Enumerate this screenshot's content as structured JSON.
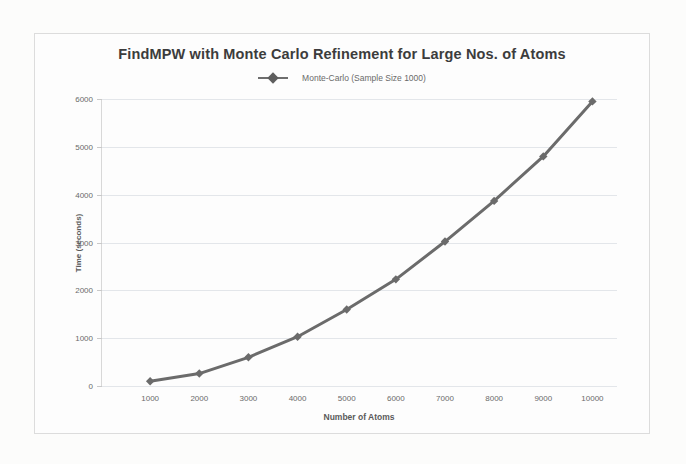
{
  "chart_data": {
    "type": "line",
    "title": "FindMPW with Monte Carlo Refinement for Large Nos. of Atoms",
    "xlabel": "Number of Atoms",
    "ylabel": "Time (seconds)",
    "xlim": [
      0,
      10500
    ],
    "ylim": [
      0,
      6000
    ],
    "grid": true,
    "legend_position": "top-center",
    "x_tick_labels": [
      "1000",
      "2000",
      "3000",
      "4000",
      "5000",
      "6000",
      "7000",
      "8000",
      "9000",
      "10000"
    ],
    "y_tick_labels": [
      "0",
      "1000",
      "2000",
      "3000",
      "4000",
      "5000",
      "6000"
    ],
    "x": [
      1000,
      2000,
      3000,
      4000,
      5000,
      6000,
      7000,
      8000,
      9000,
      10000
    ],
    "series": [
      {
        "name": "Monte-Carlo (Sample Size  1000)",
        "color": "#6b6b6b",
        "marker": "diamond",
        "values": [
          100,
          260,
          600,
          1030,
          1600,
          2230,
          3020,
          3870,
          4800,
          5950
        ]
      }
    ]
  },
  "legend": {
    "entries": [
      {
        "label": "Monte-Carlo (Sample Size  1000)"
      }
    ]
  },
  "colors": {
    "series": "#6b6b6b",
    "grid": "#e3e6ea",
    "axis": "#d8d8d8",
    "text": "#6a6a6a",
    "title": "#3c3c3c",
    "frame": "#dcdcdc",
    "background": "#fdfdfd"
  }
}
